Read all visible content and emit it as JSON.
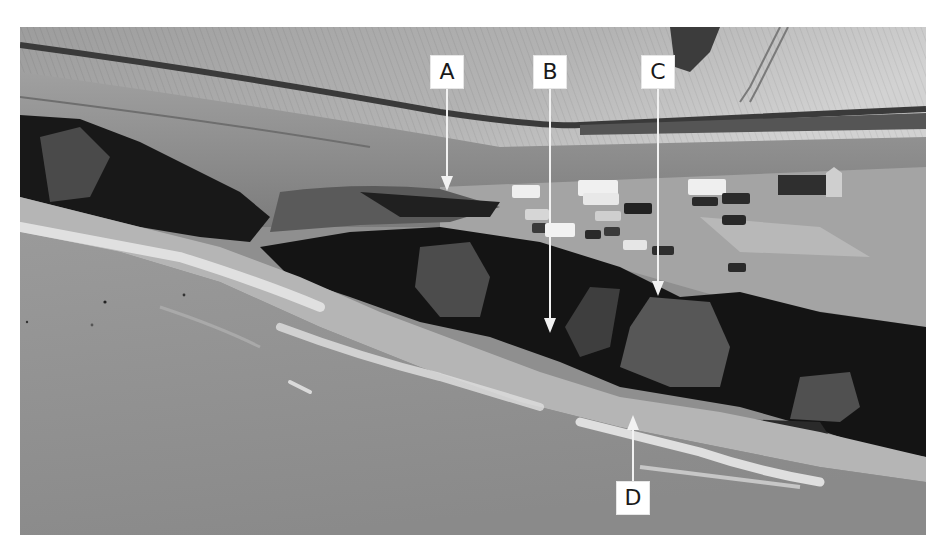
{
  "image": {
    "description": "Grayscale aerial photograph of an eroding coastline: farmland fields at top, cliff-top car park with vehicles, dark eroding cliff face, beach with surf and sea below",
    "colors": {
      "field_light": "#c9c9c9",
      "field_mid": "#a9a9a9",
      "hedge_dark": "#3a3a3a",
      "grass": "#8a8a8a",
      "carpark": "#9c9c9c",
      "cliff_dark": "#151515",
      "cliff_rock": "#4e4e4e",
      "beach": "#b8b8b8",
      "surf": "#e2e2e2",
      "sea": "#8e8e8e",
      "label_bg": "#ffffff",
      "arrow": "#f2f2f2"
    }
  },
  "annotations": [
    {
      "id": "A",
      "label": "A",
      "direction": "down",
      "box": {
        "x": 430,
        "y": 55
      },
      "tip": {
        "x": 447,
        "y": 191
      }
    },
    {
      "id": "B",
      "label": "B",
      "direction": "down",
      "box": {
        "x": 533,
        "y": 55
      },
      "tip": {
        "x": 550,
        "y": 333
      }
    },
    {
      "id": "C",
      "label": "C",
      "direction": "down",
      "box": {
        "x": 640,
        "y": 55
      },
      "tip": {
        "x": 658,
        "y": 296
      }
    },
    {
      "id": "D",
      "label": "D",
      "direction": "up",
      "box": {
        "x": 616,
        "y": 481
      },
      "tip": {
        "x": 633,
        "y": 415
      }
    }
  ]
}
